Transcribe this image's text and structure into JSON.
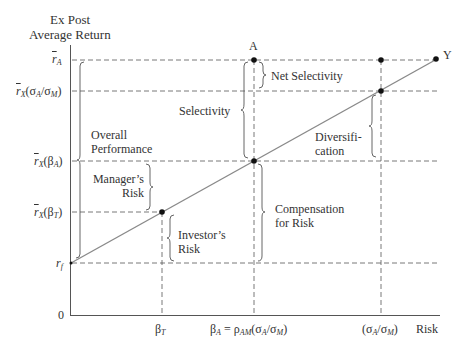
{
  "axes": {
    "y_title_line1": "Ex Post",
    "y_title_line2": "Average Return",
    "x_title": "Risk",
    "origin": "0"
  },
  "y_ticks": {
    "r_A": {
      "base": "r",
      "sub": "A"
    },
    "r_X_sigma": {
      "base": "r",
      "sub": "X",
      "suffix": "(σA/σM)"
    },
    "r_X_betaA": {
      "base": "r",
      "sub": "X",
      "suffix": "(βA)"
    },
    "r_X_betaT": {
      "base": "r",
      "sub": "X",
      "suffix": "(βT)"
    },
    "r_f": {
      "base": "r",
      "sub": "f"
    }
  },
  "x_ticks": {
    "beta_T": "βT",
    "beta_A": "βA = ρAM(σA/σM)",
    "sigma_ratio": "(σA/σM)"
  },
  "points": {
    "A": "A",
    "Y": "Y"
  },
  "brackets": {
    "overall_performance_1": "Overall",
    "overall_performance_2": "Performance",
    "managers_risk_1": "Manager’s",
    "managers_risk_2": "Risk",
    "investors_risk_1": "Investor’s",
    "investors_risk_2": "Risk",
    "selectivity": "Selectivity",
    "net_selectivity": "Net Selectivity",
    "compensation_1": "Compensation",
    "compensation_2": "for Risk",
    "diversification_1": "Diversifi-",
    "diversification_2": "cation"
  },
  "colors": {
    "axis": "#555555",
    "line": "#8a8a8a",
    "dashed": "#555555",
    "point": "#111111"
  }
}
